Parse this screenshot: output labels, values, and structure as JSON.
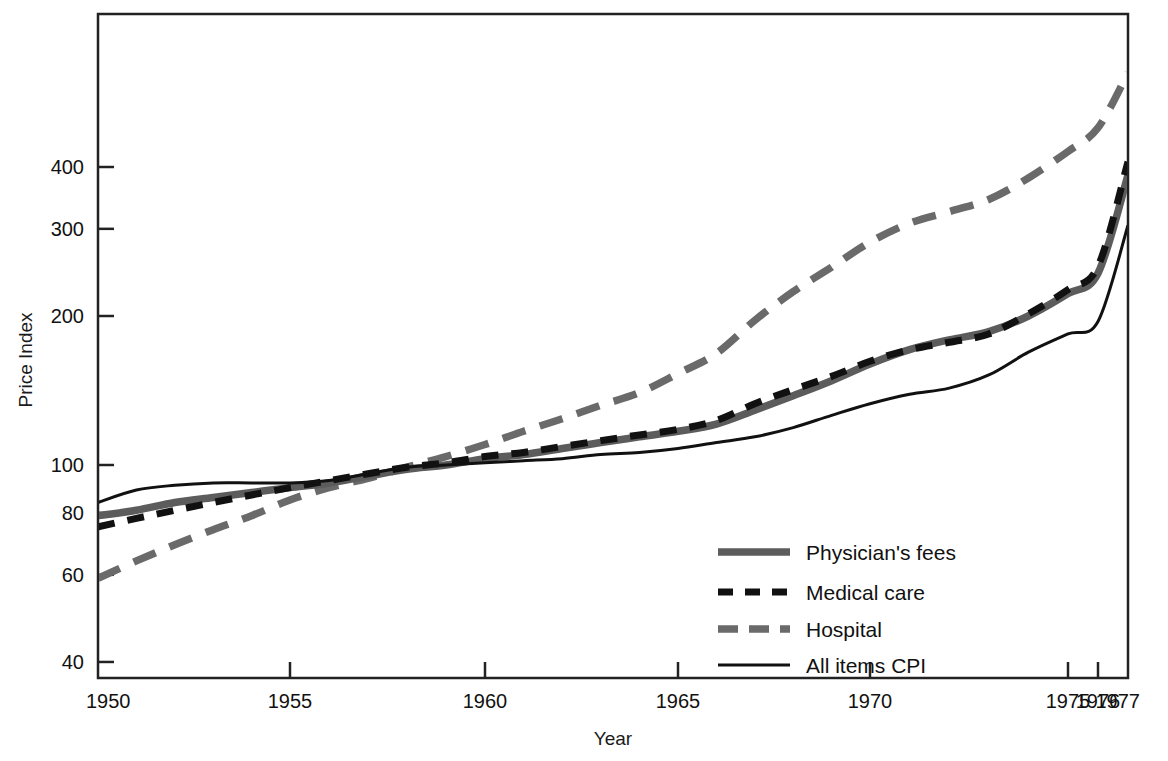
{
  "chart_data": {
    "type": "line",
    "title": "",
    "xlabel": "Year",
    "ylabel": "Price Index",
    "yscale": "log",
    "ylim": [
      40,
      640
    ],
    "xlim": [
      1950,
      1977
    ],
    "grid": false,
    "legend_position": "inside-lower-right",
    "y_ticks": [
      40,
      60,
      80,
      100,
      200,
      300,
      400
    ],
    "y_tick_labels": [
      "40",
      "60",
      "80",
      "100",
      "200",
      "300",
      "400"
    ],
    "x_ticks": [
      1950,
      1955,
      1960,
      1965,
      1970,
      1975,
      1976,
      1977
    ],
    "x_tick_labels": [
      "1950",
      "1955",
      "1960",
      "1965",
      "1970",
      "1975",
      "1976",
      "1977"
    ],
    "colors": {
      "physicians_fees": "#5c5c5c",
      "medical_care": "#111111",
      "hospital": "#6a6a6a",
      "all_items_cpi": "#111111",
      "frame": "#222222",
      "background": "#ffffff"
    },
    "x": [
      1950,
      1951,
      1952,
      1953,
      1954,
      1955,
      1956,
      1957,
      1958,
      1959,
      1960,
      1961,
      1962,
      1963,
      1964,
      1965,
      1966,
      1967,
      1968,
      1969,
      1970,
      1971,
      1972,
      1973,
      1974,
      1975,
      1976,
      1977
    ],
    "series": [
      {
        "name": "Physician's fees",
        "style": "solid-thick-gray",
        "values": [
          79,
          81,
          84,
          86,
          88,
          90,
          92,
          95,
          98,
          100,
          103,
          105,
          108,
          111,
          114,
          117,
          121,
          129,
          138,
          148,
          160,
          171,
          179,
          186,
          200,
          222,
          244,
          385
        ]
      },
      {
        "name": "Medical care",
        "style": "dashed-black",
        "values": [
          75,
          78,
          81,
          84,
          87,
          90,
          93,
          96,
          99,
          101,
          104,
          106,
          109,
          112,
          115,
          118,
          123,
          133,
          142,
          151,
          162,
          171,
          177,
          184,
          202,
          226,
          252,
          410
        ]
      },
      {
        "name": "Hospital",
        "style": "dashed-gray",
        "values": [
          59,
          64,
          69,
          74,
          79,
          85,
          90,
          94,
          99,
          104,
          110,
          117,
          124,
          132,
          140,
          153,
          168,
          196,
          224,
          251,
          282,
          308,
          325,
          344,
          380,
          430,
          480,
          620
        ]
      },
      {
        "name": "All items CPI",
        "style": "solid-thin-black",
        "values": [
          84,
          89,
          91,
          92,
          92,
          92,
          93,
          96,
          99,
          100,
          101,
          102,
          103,
          105,
          106,
          108,
          111,
          114,
          119,
          126,
          133,
          139,
          143,
          152,
          169,
          184,
          195,
          305
        ]
      }
    ],
    "legend": [
      {
        "label": "Physician's fees",
        "style": "solid-thick-gray"
      },
      {
        "label": "Medical care",
        "style": "dashed-black"
      },
      {
        "label": "Hospital",
        "style": "dashed-gray"
      },
      {
        "label": "All items CPI",
        "style": "solid-thin-black"
      }
    ]
  }
}
